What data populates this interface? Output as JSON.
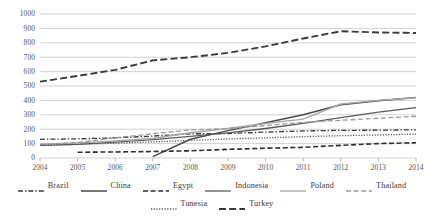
{
  "chart_data": {
    "type": "line",
    "title": "",
    "subtitle": "",
    "xlabel": "",
    "ylabel": "",
    "x": [
      2004,
      2005,
      2006,
      2007,
      2008,
      2009,
      2010,
      2011,
      2012,
      2013,
      2014
    ],
    "xtick_labels": [
      "2004",
      "2005",
      "2006",
      "2007",
      "2008",
      "2009",
      "2010",
      "2011",
      "2012",
      "2013",
      "2014"
    ],
    "ytick_labels": [
      "0",
      "100",
      "200",
      "300",
      "400",
      "500",
      "600",
      "700",
      "800",
      "900",
      "1000"
    ],
    "ytick_values": [
      0,
      100,
      200,
      300,
      400,
      500,
      600,
      700,
      800,
      900,
      1000
    ],
    "ylim": [
      0,
      1000
    ],
    "xlim": [
      2004,
      2014
    ],
    "grid": "horizontal",
    "legend_position": "bottom",
    "series": [
      {
        "name": "Brazil",
        "style": "dash-dot",
        "color": "#3a3a3a",
        "width": 1.3,
        "values": [
          130,
          133,
          140,
          152,
          168,
          170,
          180,
          188,
          192,
          193,
          196
        ]
      },
      {
        "name": "China",
        "style": "solid",
        "color": "#4a4a4a",
        "width": 1.5,
        "values": [
          null,
          null,
          null,
          10,
          130,
          190,
          245,
          300,
          370,
          398,
          420
        ]
      },
      {
        "name": "Egypt",
        "style": "dashed",
        "color": "#2e2e2e",
        "width": 1.6,
        "values": [
          null,
          40,
          42,
          45,
          50,
          60,
          68,
          74,
          88,
          100,
          106
        ]
      },
      {
        "name": "Indonesia",
        "style": "solid",
        "color": "#5a5a5a",
        "width": 1.3,
        "values": [
          88,
          95,
          110,
          128,
          150,
          175,
          205,
          240,
          280,
          318,
          350
        ]
      },
      {
        "name": "Poland",
        "style": "solid",
        "color": "#a8a8a8",
        "width": 1.4,
        "values": [
          95,
          105,
          118,
          135,
          175,
          205,
          240,
          270,
          375,
          400,
          418
        ]
      },
      {
        "name": "Thailand",
        "style": "dashed",
        "color": "#9a9a9a",
        "width": 1.3,
        "values": [
          92,
          108,
          140,
          168,
          195,
          205,
          225,
          248,
          262,
          276,
          290
        ]
      },
      {
        "name": "Tunesia",
        "style": "dotted",
        "color": "#555555",
        "width": 1.3,
        "values": [
          88,
          95,
          103,
          112,
          122,
          132,
          140,
          148,
          155,
          160,
          166
        ]
      },
      {
        "name": "Turkey",
        "style": "long-dash",
        "color": "#3a3a3a",
        "width": 1.9,
        "values": [
          530,
          570,
          612,
          678,
          700,
          730,
          775,
          830,
          880,
          872,
          868
        ]
      }
    ]
  },
  "legend": {
    "rows": [
      [
        {
          "label": "Brazil",
          "key": "brazil"
        },
        {
          "label": "China",
          "key": "china"
        },
        {
          "label": "Egypt",
          "key": "egypt"
        },
        {
          "label": "Indonesia",
          "key": "indonesia"
        },
        {
          "label": "Poland",
          "key": "poland"
        },
        {
          "label": "Thailand",
          "key": "thailand"
        }
      ],
      [
        {
          "label": "Tunesia",
          "key": "tunesia"
        },
        {
          "label": "Turkey",
          "key": "turkey"
        }
      ]
    ]
  },
  "colors": {
    "background": "#ffffff",
    "gridline": "#bfbfbf",
    "axis": "#9a9a9a",
    "text": "#3a3a3a"
  }
}
